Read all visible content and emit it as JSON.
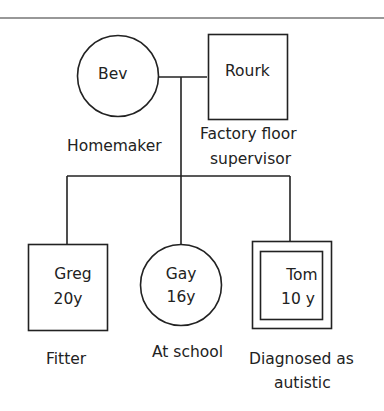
{
  "diagram": {
    "type": "genogram",
    "parents": {
      "mother": {
        "name": "Bev",
        "role": "Homemaker",
        "shape": "circle"
      },
      "father": {
        "name": "Rourk",
        "role_line1": "Factory floor",
        "role_line2": "supervisor",
        "shape": "square"
      }
    },
    "children": [
      {
        "name": "Greg",
        "age": "20y",
        "role": "Fitter",
        "shape": "square"
      },
      {
        "name": "Gay",
        "age": "16y",
        "role": "At school",
        "shape": "circle"
      },
      {
        "name": "Tom",
        "age": "10 y",
        "role_line1": "Diagnosed as",
        "role_line2": "autistic",
        "shape": "double-square"
      }
    ]
  },
  "colors": {
    "line": "#222222",
    "background": "#ffffff"
  }
}
